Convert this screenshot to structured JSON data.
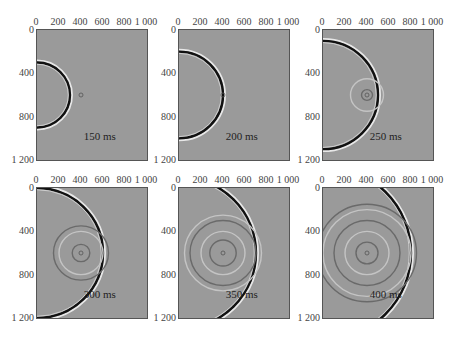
{
  "chart_data": [
    {
      "type": "heatmap",
      "title": "150 ms",
      "time_label": "150 ms",
      "x_ticks": [
        "0",
        "200",
        "400",
        "600",
        "800",
        "1 000"
      ],
      "y_ticks": [
        "0",
        "400",
        "800",
        "1 200"
      ],
      "xlim": [
        0,
        1000
      ],
      "ylim": [
        0,
        1200
      ],
      "source": [
        0,
        600
      ],
      "scatterer": [
        400,
        600
      ],
      "wavefront_radius": 300,
      "scatter_rings": []
    },
    {
      "type": "heatmap",
      "title": "200 ms",
      "time_label": "200 ms",
      "x_ticks": [
        "0",
        "200",
        "400",
        "600",
        "800",
        "1 000"
      ],
      "y_ticks": [
        "0",
        "400",
        "800",
        "1 200"
      ],
      "xlim": [
        0,
        1000
      ],
      "ylim": [
        0,
        1200
      ],
      "source": [
        0,
        600
      ],
      "scatterer": [
        400,
        600
      ],
      "wavefront_radius": 400,
      "scatter_rings": []
    },
    {
      "type": "heatmap",
      "title": "250 ms",
      "time_label": "250 ms",
      "x_ticks": [
        "0",
        "200",
        "400",
        "600",
        "800",
        "1 000"
      ],
      "y_ticks": [
        "0",
        "400",
        "800",
        "1 200"
      ],
      "xlim": [
        0,
        1000
      ],
      "ylim": [
        0,
        1200
      ],
      "source": [
        0,
        600
      ],
      "scatterer": [
        400,
        600
      ],
      "wavefront_radius": 500,
      "scatter_rings": [
        50,
        150
      ]
    },
    {
      "type": "heatmap",
      "title": "300 ms",
      "time_label": "300 ms",
      "x_ticks": [
        "0",
        "200",
        "400",
        "600",
        "800",
        "1 000"
      ],
      "y_ticks": [
        "0",
        "400",
        "800",
        "1 200"
      ],
      "xlim": [
        0,
        1000
      ],
      "ylim": [
        0,
        1200
      ],
      "source": [
        0,
        600
      ],
      "scatterer": [
        400,
        600
      ],
      "wavefront_radius": 600,
      "scatter_rings": [
        80,
        200,
        250
      ]
    },
    {
      "type": "heatmap",
      "title": "350 ms",
      "time_label": "350 ms",
      "x_ticks": [
        "0",
        "200",
        "400",
        "600",
        "800",
        "1 000"
      ],
      "y_ticks": [
        "0",
        "400",
        "800",
        "1 200"
      ],
      "xlim": [
        0,
        1000
      ],
      "ylim": [
        0,
        1200
      ],
      "source": [
        0,
        600
      ],
      "scatterer": [
        400,
        600
      ],
      "wavefront_radius": 700,
      "scatter_rings": [
        120,
        200,
        300,
        350
      ]
    },
    {
      "type": "heatmap",
      "title": "400 ms",
      "time_label": "400 ms",
      "x_ticks": [
        "0",
        "200",
        "400",
        "600",
        "800",
        "1 000"
      ],
      "y_ticks": [
        "0",
        "400",
        "800",
        "1 200"
      ],
      "xlim": [
        0,
        1000
      ],
      "ylim": [
        0,
        1200
      ],
      "source": [
        0,
        600
      ],
      "scatterer": [
        400,
        600
      ],
      "wavefront_radius": 800,
      "scatter_rings": [
        100,
        200,
        300,
        400,
        450
      ]
    }
  ],
  "colors": {
    "background": "#9a9a9a",
    "dark": "#111111",
    "light": "#e8e8e8"
  }
}
